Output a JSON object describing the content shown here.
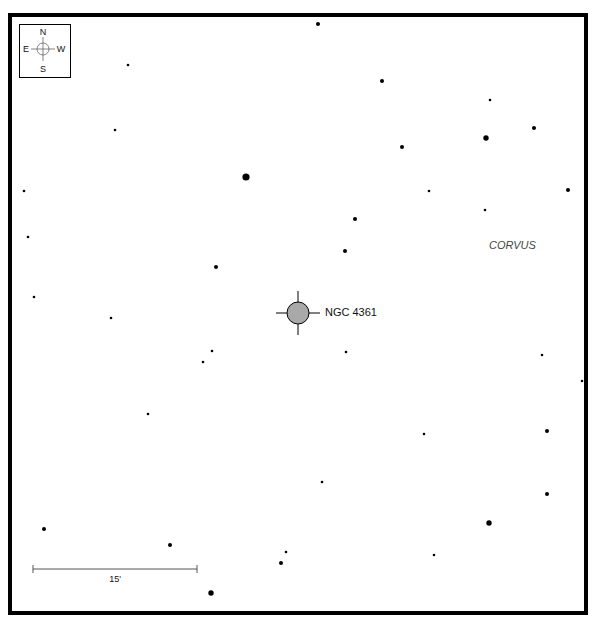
{
  "chart_data": {
    "type": "scatter",
    "title": "",
    "object": {
      "name": "NGC 4361",
      "symbol": "planetary-nebula",
      "fill_color": "#a9a9a9"
    },
    "constellation_label": "CORVUS",
    "compass": {
      "north": "N",
      "south": "S",
      "east": "E",
      "west": "W"
    },
    "scale_bar": {
      "label": "15'"
    },
    "stars": [
      {
        "x": 318,
        "y": 24,
        "mag": 2
      },
      {
        "x": 128,
        "y": 65,
        "mag": 1
      },
      {
        "x": 382,
        "y": 81,
        "mag": 2
      },
      {
        "x": 490,
        "y": 100,
        "mag": 1
      },
      {
        "x": 115,
        "y": 130,
        "mag": 1
      },
      {
        "x": 534,
        "y": 128,
        "mag": 2
      },
      {
        "x": 486,
        "y": 138,
        "mag": 3
      },
      {
        "x": 402,
        "y": 147,
        "mag": 2
      },
      {
        "x": 246,
        "y": 177,
        "mag": 4
      },
      {
        "x": 24,
        "y": 191,
        "mag": 1
      },
      {
        "x": 429,
        "y": 191,
        "mag": 1
      },
      {
        "x": 568,
        "y": 190,
        "mag": 2
      },
      {
        "x": 485,
        "y": 210,
        "mag": 1
      },
      {
        "x": 355,
        "y": 219,
        "mag": 2
      },
      {
        "x": 28,
        "y": 237,
        "mag": 1
      },
      {
        "x": 345,
        "y": 251,
        "mag": 2
      },
      {
        "x": 216,
        "y": 267,
        "mag": 2
      },
      {
        "x": 34,
        "y": 297,
        "mag": 1
      },
      {
        "x": 111,
        "y": 318,
        "mag": 1
      },
      {
        "x": 212,
        "y": 351,
        "mag": 1
      },
      {
        "x": 346,
        "y": 352,
        "mag": 1
      },
      {
        "x": 542,
        "y": 355,
        "mag": 1
      },
      {
        "x": 203,
        "y": 362,
        "mag": 1
      },
      {
        "x": 582,
        "y": 381,
        "mag": 1
      },
      {
        "x": 148,
        "y": 414,
        "mag": 1
      },
      {
        "x": 424,
        "y": 434,
        "mag": 1
      },
      {
        "x": 547,
        "y": 431,
        "mag": 2
      },
      {
        "x": 322,
        "y": 482,
        "mag": 1
      },
      {
        "x": 547,
        "y": 494,
        "mag": 2
      },
      {
        "x": 489,
        "y": 523,
        "mag": 3
      },
      {
        "x": 44,
        "y": 529,
        "mag": 2
      },
      {
        "x": 170,
        "y": 545,
        "mag": 2
      },
      {
        "x": 286,
        "y": 552,
        "mag": 1
      },
      {
        "x": 434,
        "y": 555,
        "mag": 1
      },
      {
        "x": 281,
        "y": 563,
        "mag": 2
      },
      {
        "x": 211,
        "y": 593,
        "mag": 3
      }
    ]
  }
}
